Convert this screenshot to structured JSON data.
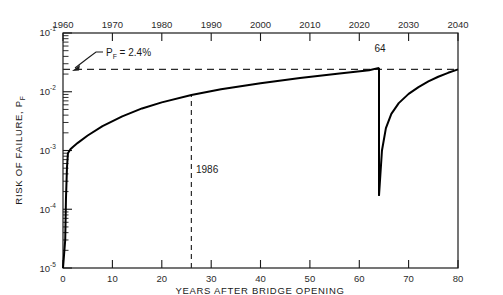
{
  "chart_data": {
    "type": "line",
    "title": "",
    "xlabel": "YEARS AFTER BRIDGE OPENING",
    "ylabel": "RISK OF FAILURE, P_F",
    "ylabel_display": "RISK OF FAILURE, P",
    "ylabel_sub": "F",
    "yscale": "log",
    "ylim": [
      1e-05,
      0.1
    ],
    "xlim": [
      0,
      80
    ],
    "grid": false,
    "legend": null,
    "x_ticks": [
      0,
      10,
      20,
      30,
      40,
      50,
      60,
      70,
      80
    ],
    "x_tick_labels": [
      "0",
      "10",
      "20",
      "30",
      "40",
      "50",
      "60",
      "70",
      "80"
    ],
    "top_axis_label": "Calendar year",
    "top_ticks": [
      0,
      10,
      20,
      30,
      40,
      50,
      60,
      70,
      80
    ],
    "top_tick_labels": [
      "1960",
      "1970",
      "1980",
      "1990",
      "2000",
      "2010",
      "2020",
      "2030",
      "2040"
    ],
    "y_ticks": [
      0.1,
      0.01,
      0.001,
      0.0001,
      1e-05
    ],
    "y_tick_mantissa": [
      "10",
      "10",
      "10",
      "10",
      "10"
    ],
    "y_tick_exponents": [
      "-1",
      "-2",
      "-3",
      "-4",
      "-5"
    ],
    "series": [
      {
        "name": "Risk of failure",
        "comment": "Cumulative risk of failure vs years after bridge opening; repair at year 64 resets risk.",
        "points": [
          [
            0.0,
            1e-05
          ],
          [
            0.45,
            3e-05
          ],
          [
            0.6,
            0.00015
          ],
          [
            0.8,
            0.0005
          ],
          [
            1.0,
            0.0009
          ],
          [
            1.5,
            0.00105
          ],
          [
            2.0,
            0.00115
          ],
          [
            3.0,
            0.00135
          ],
          [
            5.0,
            0.0018
          ],
          [
            8.0,
            0.0026
          ],
          [
            12.0,
            0.0038
          ],
          [
            16.0,
            0.0052
          ],
          [
            20.0,
            0.0066
          ],
          [
            26.0,
            0.0088
          ],
          [
            32.0,
            0.011
          ],
          [
            40.0,
            0.014
          ],
          [
            48.0,
            0.0172
          ],
          [
            56.0,
            0.0205
          ],
          [
            62.0,
            0.0232
          ],
          [
            64.0,
            0.0255
          ]
        ]
      },
      {
        "name": "Post-repair recovery",
        "comment": "After repair at year 64 risk drops to 1.7e-4 then climbs back to 2.4e-2 by year 80.",
        "points": [
          [
            64.0,
            0.00017
          ],
          [
            64.6,
            0.001
          ],
          [
            65.4,
            0.0024
          ],
          [
            66.5,
            0.0042
          ],
          [
            68.0,
            0.0064
          ],
          [
            70.0,
            0.0092
          ],
          [
            72.0,
            0.012
          ],
          [
            74.0,
            0.015
          ],
          [
            76.0,
            0.018
          ],
          [
            78.0,
            0.021
          ],
          [
            80.0,
            0.024
          ]
        ]
      }
    ],
    "drop_segment": {
      "name": "repair-drop",
      "x": 64.0,
      "y_top": 0.0255,
      "y_bottom": 0.00017
    },
    "annotations": [
      {
        "id": "pf-threshold",
        "text": "P_F = 2.4%",
        "text_main": "P",
        "text_sub": "F",
        "text_rest": " = 2.4%",
        "value": 0.024,
        "kind": "leader-arrow",
        "target_x": 1.2,
        "target_y": 0.024
      },
      {
        "id": "repair-year",
        "text": "64",
        "value": 64,
        "kind": "point-label",
        "x": 64,
        "y": 0.0255
      },
      {
        "id": "inspection-year",
        "text": "1986",
        "value": 1986,
        "kind": "vline-label",
        "x": 26,
        "y_top": 0.0088
      }
    ],
    "threshold_line": {
      "name": "P_F = 2.4% threshold",
      "y": 0.024,
      "style": "dashed",
      "x_from": 0,
      "x_to": 80
    },
    "vertical_marker": {
      "name": "1986 inspection",
      "x": 26,
      "style": "dashed",
      "y_from": 1e-05,
      "y_to": 0.0088
    },
    "colors": {
      "curve": "#000000",
      "dash": "#2a2a2a",
      "axis": "#1a1a1a",
      "text": "#2b2b2b",
      "background": "#ffffff"
    }
  }
}
